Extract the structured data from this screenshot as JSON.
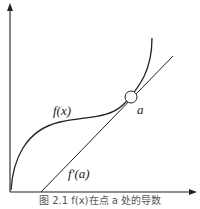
{
  "figure": {
    "caption": "图 2.1  f(x)在点 a 处的导数",
    "labels": {
      "function": "f(x)",
      "point": "a",
      "derivative": "f′(a)"
    }
  }
}
